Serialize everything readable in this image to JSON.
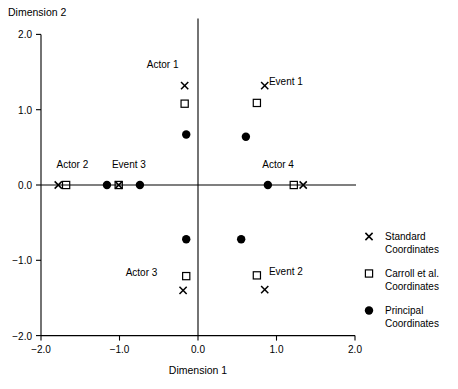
{
  "chart_data": {
    "type": "scatter",
    "title": "",
    "xlabel": "Dimension 1",
    "ylabel": "Dimension 2",
    "xlim": [
      -2.0,
      2.0
    ],
    "ylim": [
      -2.0,
      2.0
    ],
    "xticks": [
      "-2.0",
      "-1.0",
      "0.0",
      "1.0",
      "2.0"
    ],
    "yticks": [
      "2.0",
      "1.0",
      "0.0",
      "-1.0",
      "-2.0"
    ],
    "xtick_values": [
      -2.0,
      -1.0,
      0.0,
      1.0,
      2.0
    ],
    "ytick_values": [
      2.0,
      1.0,
      0.0,
      -1.0,
      -2.0
    ],
    "grid": false,
    "legend_position": "right",
    "series": [
      {
        "name": "Standard Coordinates",
        "marker": "cross",
        "points": [
          {
            "label": "Actor 1",
            "x": -0.17,
            "y": 1.32
          },
          {
            "label": "Actor 2",
            "x": -1.78,
            "y": 0.0
          },
          {
            "label": "Actor 3",
            "x": -0.19,
            "y": -1.4
          },
          {
            "label": "Actor 4",
            "x": 1.34,
            "y": 0.0
          },
          {
            "label": "Event 1",
            "x": 0.85,
            "y": 1.32
          },
          {
            "label": "Event 2",
            "x": 0.85,
            "y": -1.39
          },
          {
            "label": "Event 3",
            "x": -1.01,
            "y": 0.0
          }
        ]
      },
      {
        "name": "Carroll et al. Coordinates",
        "marker": "square",
        "points": [
          {
            "label": "Actor 1",
            "x": -0.17,
            "y": 1.08
          },
          {
            "label": "Actor 2",
            "x": -1.68,
            "y": 0.0
          },
          {
            "label": "Actor 3",
            "x": -0.15,
            "y": -1.21
          },
          {
            "label": "Actor 4",
            "x": 1.22,
            "y": 0.0
          },
          {
            "label": "Event 1",
            "x": 0.75,
            "y": 1.09
          },
          {
            "label": "Event 2",
            "x": 0.75,
            "y": -1.2
          },
          {
            "label": "Event 3",
            "x": -1.01,
            "y": 0.0
          }
        ]
      },
      {
        "name": "Principal Coordinates",
        "marker": "dot",
        "points": [
          {
            "label": "Actor 1",
            "x": -0.15,
            "y": 0.67
          },
          {
            "label": "Actor 2",
            "x": -1.16,
            "y": 0.0
          },
          {
            "label": "Actor 3",
            "x": -0.15,
            "y": -0.72
          },
          {
            "label": "Actor 4",
            "x": 0.89,
            "y": 0.0
          },
          {
            "label": "Event 1",
            "x": 0.61,
            "y": 0.64
          },
          {
            "label": "Event 2",
            "x": 0.55,
            "y": -0.72
          },
          {
            "label": "Event 3",
            "x": -0.74,
            "y": 0.0
          }
        ]
      }
    ],
    "annotations": [
      {
        "text": "Actor 1",
        "x": -0.45,
        "y": 1.55
      },
      {
        "text": "Actor 2",
        "x": -1.6,
        "y": 0.22
      },
      {
        "text": "Event 3",
        "x": -0.88,
        "y": 0.22
      },
      {
        "text": "Actor 4",
        "x": 1.02,
        "y": 0.22
      },
      {
        "text": "Event 1",
        "x": 1.12,
        "y": 1.33
      },
      {
        "text": "Actor 3",
        "x": -0.72,
        "y": -1.21
      },
      {
        "text": "Event 2",
        "x": 1.12,
        "y": -1.2
      }
    ],
    "legend": [
      {
        "marker": "cross",
        "line1": "Standard",
        "line2": "Coordinates"
      },
      {
        "marker": "square",
        "line1": "Carroll et al.",
        "line2": "Coordinates"
      },
      {
        "marker": "dot",
        "line1": "Principal",
        "line2": "Coordinates"
      }
    ]
  }
}
